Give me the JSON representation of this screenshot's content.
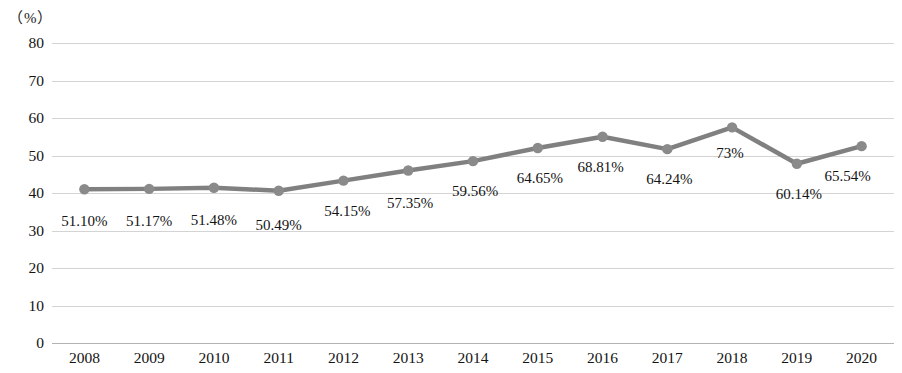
{
  "chart_data": {
    "type": "line",
    "title": "",
    "subtitle": "",
    "xlabel": "",
    "ylabel": "（%）",
    "unit_label": "（%）",
    "categories": [
      "2008",
      "2009",
      "2010",
      "2011",
      "2012",
      "2013",
      "2014",
      "2015",
      "2016",
      "2017",
      "2018",
      "2019",
      "2020"
    ],
    "values": [
      41.0,
      41.1,
      41.4,
      40.6,
      43.3,
      46.0,
      48.5,
      52.0,
      55.0,
      51.7,
      57.5,
      47.8,
      52.5
    ],
    "point_labels": [
      "51.10%",
      "51.17%",
      "51.48%",
      "50.49%",
      "54.15%",
      "57.35%",
      "59.56%",
      "64.65%",
      "68.81%",
      "64.24%",
      "73%",
      "60.14%",
      "65.54%"
    ],
    "yticks": [
      0,
      10,
      20,
      30,
      40,
      50,
      60,
      70,
      80
    ],
    "ytick_labels": [
      "0",
      "10",
      "20",
      "30",
      "40",
      "50",
      "60",
      "70",
      "80"
    ],
    "ylim": [
      0,
      80
    ],
    "grid": true,
    "legend": "none",
    "series_color": "#808080",
    "marker_color": "#8a8a8a",
    "grid_color": "#d4d4d4",
    "axis_color": "#b3b3b3",
    "text_color": "#141414"
  },
  "label_offsets": [
    {
      "dx": 0,
      "dy": 24
    },
    {
      "dx": 0,
      "dy": 24
    },
    {
      "dx": 0,
      "dy": 24
    },
    {
      "dx": 0,
      "dy": 26
    },
    {
      "dx": 4,
      "dy": 22
    },
    {
      "dx": 2,
      "dy": 24
    },
    {
      "dx": 2,
      "dy": 22
    },
    {
      "dx": 2,
      "dy": 22
    },
    {
      "dx": -2,
      "dy": 22
    },
    {
      "dx": 2,
      "dy": 22
    },
    {
      "dx": -2,
      "dy": 18
    },
    {
      "dx": 2,
      "dy": 22
    },
    {
      "dx": -14,
      "dy": 22
    }
  ]
}
